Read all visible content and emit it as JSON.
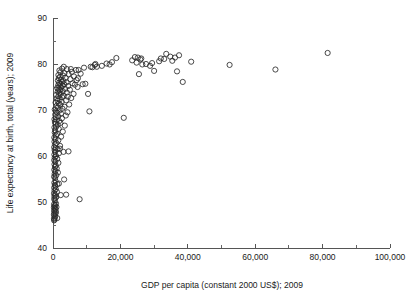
{
  "chart_data": {
    "type": "scatter",
    "title": "",
    "xlabel": "GDP per capita (constant 2000 US$); 2009",
    "ylabel": "Life expectancy at birth, total (years); 2009",
    "xlim": [
      0,
      100000
    ],
    "ylim": [
      40,
      90
    ],
    "x_ticks": [
      0,
      20000,
      40000,
      60000,
      80000,
      100000
    ],
    "x_tick_labels": [
      "0",
      "20,000",
      "40,000",
      "60,000",
      "80,000",
      "100,000"
    ],
    "x_minor_step": 10000,
    "y_ticks": [
      40,
      50,
      60,
      70,
      80,
      90
    ],
    "y_tick_labels": [
      "40",
      "50",
      "60",
      "70",
      "80",
      "90"
    ],
    "y_minor_step": 5,
    "grid": false,
    "legend": false,
    "marker": "open-circle",
    "marker_color": "#2b2b2b",
    "marker_radius": 2.6,
    "points": [
      [
        330,
        46.0
      ],
      [
        420,
        46.2
      ],
      [
        300,
        46.4
      ],
      [
        520,
        46.6
      ],
      [
        640,
        46.9
      ],
      [
        260,
        47.2
      ],
      [
        700,
        47.4
      ],
      [
        380,
        47.6
      ],
      [
        900,
        47.8
      ],
      [
        480,
        48.0
      ],
      [
        340,
        48.2
      ],
      [
        760,
        48.4
      ],
      [
        560,
        48.6
      ],
      [
        280,
        48.8
      ],
      [
        1020,
        48.9
      ],
      [
        430,
        49.1
      ],
      [
        650,
        49.3
      ],
      [
        310,
        49.5
      ],
      [
        880,
        49.7
      ],
      [
        1250,
        46.5
      ],
      [
        7900,
        50.6
      ],
      [
        2300,
        51.5
      ],
      [
        520,
        50.4
      ],
      [
        360,
        50.7
      ],
      [
        740,
        50.9
      ],
      [
        980,
        51.1
      ],
      [
        420,
        51.3
      ],
      [
        610,
        51.6
      ],
      [
        300,
        51.9
      ],
      [
        1150,
        52.2
      ],
      [
        470,
        52.5
      ],
      [
        830,
        52.8
      ],
      [
        350,
        53.1
      ],
      [
        690,
        53.4
      ],
      [
        540,
        53.7
      ],
      [
        1300,
        53.9
      ],
      [
        400,
        54.2
      ],
      [
        760,
        54.5
      ],
      [
        3300,
        54.9
      ],
      [
        620,
        55.2
      ],
      [
        330,
        55.5
      ],
      [
        950,
        55.8
      ],
      [
        480,
        56.1
      ],
      [
        1450,
        56.4
      ],
      [
        700,
        56.7
      ],
      [
        390,
        57.0
      ],
      [
        1100,
        57.3
      ],
      [
        560,
        57.6
      ],
      [
        840,
        57.9
      ],
      [
        440,
        58.2
      ],
      [
        1600,
        58.5
      ],
      [
        670,
        58.8
      ],
      [
        360,
        59.1
      ],
      [
        1250,
        59.4
      ],
      [
        520,
        59.7
      ],
      [
        910,
        60.0
      ],
      [
        410,
        60.3
      ],
      [
        1750,
        60.6
      ],
      [
        640,
        60.9
      ],
      [
        3100,
        60.9
      ],
      [
        480,
        61.3
      ],
      [
        1350,
        61.5
      ],
      [
        760,
        61.7
      ],
      [
        350,
        61.9
      ],
      [
        2100,
        62.2
      ],
      [
        590,
        62.5
      ],
      [
        1050,
        62.8
      ],
      [
        430,
        63.1
      ],
      [
        1580,
        63.4
      ],
      [
        700,
        63.7
      ],
      [
        380,
        64.0
      ],
      [
        2400,
        64.2
      ],
      [
        870,
        64.5
      ],
      [
        1200,
        64.8
      ],
      [
        510,
        65.1
      ],
      [
        2900,
        65.3
      ],
      [
        640,
        65.6
      ],
      [
        1700,
        65.9
      ],
      [
        420,
        66.2
      ],
      [
        980,
        66.4
      ],
      [
        3500,
        66.6
      ],
      [
        1400,
        66.8
      ],
      [
        740,
        67.0
      ],
      [
        2200,
        67.2
      ],
      [
        560,
        67.4
      ],
      [
        1850,
        67.6
      ],
      [
        1100,
        67.8
      ],
      [
        430,
        68.0
      ],
      [
        2650,
        68.2
      ],
      [
        820,
        68.4
      ],
      [
        1550,
        68.6
      ],
      [
        3800,
        68.8
      ],
      [
        660,
        69.0
      ],
      [
        2350,
        69.2
      ],
      [
        1250,
        69.4
      ],
      [
        4300,
        69.5
      ],
      [
        900,
        69.7
      ],
      [
        10800,
        69.7
      ],
      [
        1950,
        69.9
      ],
      [
        520,
        70.1
      ],
      [
        2800,
        70.3
      ],
      [
        1450,
        70.5
      ],
      [
        3400,
        70.7
      ],
      [
        1080,
        70.9
      ],
      [
        2150,
        71.1
      ],
      [
        4800,
        71.2
      ],
      [
        1700,
        71.4
      ],
      [
        760,
        71.6
      ],
      [
        2550,
        71.8
      ],
      [
        1350,
        72.0
      ],
      [
        3900,
        72.1
      ],
      [
        2000,
        72.3
      ],
      [
        1150,
        72.5
      ],
      [
        5400,
        72.6
      ],
      [
        2700,
        72.8
      ],
      [
        1600,
        73.0
      ],
      [
        3200,
        73.1
      ],
      [
        940,
        73.3
      ],
      [
        2300,
        73.5
      ],
      [
        6100,
        73.5
      ],
      [
        1850,
        73.7
      ],
      [
        4100,
        73.8
      ],
      [
        1400,
        74.0
      ],
      [
        2900,
        74.1
      ],
      [
        10400,
        73.5
      ],
      [
        2100,
        74.3
      ],
      [
        5000,
        74.4
      ],
      [
        1650,
        74.5
      ],
      [
        3600,
        74.6
      ],
      [
        1250,
        74.8
      ],
      [
        2450,
        74.9
      ],
      [
        7300,
        75.0
      ],
      [
        1950,
        75.1
      ],
      [
        4500,
        75.2
      ],
      [
        2800,
        75.3
      ],
      [
        1550,
        75.4
      ],
      [
        6500,
        75.5
      ],
      [
        3300,
        75.6
      ],
      [
        2200,
        75.7
      ],
      [
        8800,
        75.6
      ],
      [
        5800,
        75.8
      ],
      [
        1800,
        75.9
      ],
      [
        4000,
        76.0
      ],
      [
        2600,
        76.1
      ],
      [
        9600,
        75.7
      ],
      [
        38500,
        76.1
      ],
      [
        3100,
        76.3
      ],
      [
        1450,
        76.4
      ],
      [
        7000,
        76.5
      ],
      [
        2350,
        76.6
      ],
      [
        5200,
        76.7
      ],
      [
        1700,
        76.9
      ],
      [
        3700,
        77.0
      ],
      [
        2050,
        77.2
      ],
      [
        6200,
        77.3
      ],
      [
        2900,
        77.5
      ],
      [
        1600,
        77.6
      ],
      [
        4600,
        77.8
      ],
      [
        8200,
        77.9
      ],
      [
        25500,
        77.8
      ],
      [
        3400,
        78.0
      ],
      [
        2200,
        78.2
      ],
      [
        5600,
        78.3
      ],
      [
        36800,
        78.4
      ],
      [
        30000,
        78.5
      ],
      [
        1900,
        78.6
      ],
      [
        7600,
        78.7
      ],
      [
        66000,
        78.8
      ],
      [
        4100,
        78.9
      ],
      [
        2700,
        79.0
      ],
      [
        9200,
        79.2
      ],
      [
        11700,
        79.3
      ],
      [
        13000,
        79.4
      ],
      [
        52400,
        79.8
      ],
      [
        3200,
        79.4
      ],
      [
        14500,
        79.6
      ],
      [
        28800,
        79.6
      ],
      [
        16800,
        79.9
      ],
      [
        26500,
        79.9
      ],
      [
        27600,
        80.0
      ],
      [
        15900,
        80.1
      ],
      [
        12600,
        80.0
      ],
      [
        29400,
        80.2
      ],
      [
        24800,
        80.3
      ],
      [
        41000,
        80.5
      ],
      [
        17500,
        80.4
      ],
      [
        31500,
        80.6
      ],
      [
        35400,
        80.7
      ],
      [
        23500,
        80.8
      ],
      [
        25900,
        81.0
      ],
      [
        18800,
        81.3
      ],
      [
        26200,
        81.2
      ],
      [
        33000,
        81.1
      ],
      [
        36200,
        81.4
      ],
      [
        24300,
        81.5
      ],
      [
        32000,
        81.2
      ],
      [
        25200,
        81.4
      ],
      [
        34800,
        81.6
      ],
      [
        37400,
        81.9
      ],
      [
        33600,
        82.2
      ],
      [
        81500,
        82.4
      ],
      [
        21000,
        68.3
      ],
      [
        4600,
        61.0
      ],
      [
        3900,
        51.6
      ],
      [
        5300,
        78.9
      ],
      [
        6800,
        78.7
      ],
      [
        7400,
        76.9
      ],
      [
        11200,
        79.4
      ],
      [
        12400,
        79.8
      ],
      [
        4400,
        72.9
      ],
      [
        2050,
        61.6
      ],
      [
        1750,
        54.0
      ]
    ]
  },
  "geometry": {
    "plot_left": 53,
    "plot_right": 390,
    "plot_top": 18,
    "plot_bottom": 248
  }
}
